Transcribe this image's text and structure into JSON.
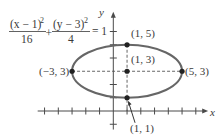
{
  "chart_data": {
    "type": "line",
    "title": "",
    "equation": {
      "term1_numerator": "(x − 1)",
      "term1_exponent": "2",
      "term1_denominator": "16",
      "plus": "+",
      "term2_numerator": "(y − 3)",
      "term2_exponent": "2",
      "term2_denominator": "4",
      "equals": "= 1"
    },
    "ellipse": {
      "center": [
        1,
        3
      ],
      "a": 4,
      "b": 2
    },
    "xlabel": "x",
    "ylabel": "y",
    "xlim": [
      -5.5,
      6.9
    ],
    "ylim": [
      -1.4,
      7.5
    ],
    "x_ticks": [
      -5,
      -4,
      -3,
      -2,
      -1,
      1,
      2,
      3,
      4,
      5,
      6
    ],
    "y_ticks": [
      -1,
      1,
      2,
      4,
      5,
      6
    ],
    "points": [
      {
        "x": 1,
        "y": 5,
        "label": "(1, 5)",
        "label_pos": "above-right"
      },
      {
        "x": 1,
        "y": 3,
        "label": "(1, 3)",
        "label_pos": "above-right"
      },
      {
        "x": -3,
        "y": 3,
        "label": "(−3, 3)",
        "label_pos": "left"
      },
      {
        "x": 5,
        "y": 3,
        "label": "(5, 3)",
        "label_pos": "right"
      },
      {
        "x": 1,
        "y": 1,
        "label": "(1, 1)",
        "label_pos": "below-right-arrow"
      }
    ],
    "dashed_lines": [
      {
        "from": [
          -3,
          3
        ],
        "to": [
          5,
          3
        ]
      },
      {
        "from": [
          1,
          5
        ],
        "to": [
          1,
          0
        ]
      }
    ],
    "colors": {
      "curve": "#666666",
      "axis": "#4a4a4a",
      "point": "#222222",
      "text": "#3a3a3a"
    }
  }
}
